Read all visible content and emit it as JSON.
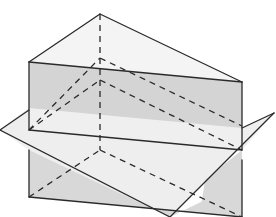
{
  "diagram": {
    "colors": {
      "background": "#ffffff",
      "line": "#2a2a2a",
      "front_face_fill": "#d6d6d6",
      "top_face_fill": "#f4f4f4",
      "plane_fill": "#ececec",
      "plane_lower_fill": "#dcdcdc"
    },
    "vertices": {
      "top_back": [
        100,
        14
      ],
      "top_front_left": [
        29,
        62
      ],
      "top_front_right": [
        242,
        82
      ],
      "bottom_back": [
        100,
        150
      ],
      "bottom_front_left": [
        29,
        197
      ],
      "bottom_front_right": [
        242,
        217
      ]
    },
    "plane": {
      "left": [
        0,
        130
      ],
      "right": [
        274,
        146
      ],
      "bottom": [
        170,
        217
      ]
    },
    "line_styles": {
      "visible": "solid",
      "hidden": "dashed"
    }
  }
}
